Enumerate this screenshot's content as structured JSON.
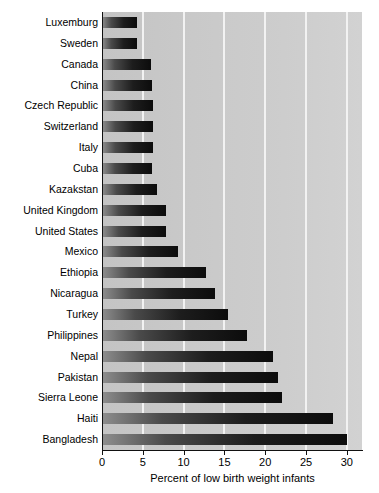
{
  "chart_data": {
    "type": "bar",
    "orientation": "horizontal",
    "title": "",
    "subtitle": "",
    "xlabel": "Percent of low birth weight infants",
    "ylabel": "",
    "xlim": [
      0,
      32
    ],
    "xticks": [
      0,
      5,
      10,
      15,
      20,
      25,
      30
    ],
    "xtick_labels": [
      "0",
      "5",
      "10",
      "15",
      "20",
      "25",
      "30"
    ],
    "grid": true,
    "grid_axis": "x",
    "legend": false,
    "legend_position": "none",
    "plot_background_color": "#c9c9c9",
    "gridline_color": "#f2f2f2",
    "bar_color_start": "#8e8e8e",
    "bar_color_end": "#0c0c0c",
    "categories": [
      "Luxemburg",
      "Sweden",
      "Canada",
      "China",
      "Czech Republic",
      "Switzerland",
      "Italy",
      "Cuba",
      "Kazakstan",
      "United Kingdom",
      "United States",
      "Mexico",
      "Ethiopia",
      "Nicaragua",
      "Turkey",
      "Philippines",
      "Nepal",
      "Pakistan",
      "Sierra Leone",
      "Haiti",
      "Bangladesh"
    ],
    "values": [
      4.3,
      4.3,
      6.0,
      6.1,
      6.2,
      6.2,
      6.2,
      6.1,
      6.7,
      7.8,
      7.8,
      9.3,
      12.7,
      13.9,
      15.4,
      17.8,
      21.0,
      21.6,
      22.0,
      28.3,
      30.0
    ]
  }
}
